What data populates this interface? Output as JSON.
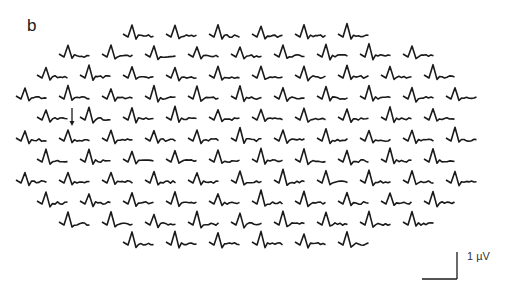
{
  "figure": {
    "panel_label": "b",
    "scale_bar": {
      "label": "1 µV",
      "vertical_px": 27,
      "horizontal_px": 35
    },
    "trace_color": "#1a1a1a",
    "annotation": {
      "type": "arrow-down",
      "row": 4,
      "after_index": 0
    }
  },
  "chart_data": {
    "type": "multi-trace-array",
    "title": "",
    "rows": [
      {
        "y": 35,
        "x_start": 137,
        "count": 6
      },
      {
        "y": 55,
        "x_start": 73,
        "count": 9
      },
      {
        "y": 76,
        "x_start": 51,
        "count": 10
      },
      {
        "y": 97,
        "x_start": 30,
        "count": 11
      },
      {
        "y": 118,
        "x_start": 51,
        "count": 10
      },
      {
        "y": 139,
        "x_start": 30,
        "count": 11
      },
      {
        "y": 160,
        "x_start": 51,
        "count": 10
      },
      {
        "y": 181,
        "x_start": 30,
        "count": 11
      },
      {
        "y": 202,
        "x_start": 51,
        "count": 10
      },
      {
        "y": 223,
        "x_start": 73,
        "count": 9
      },
      {
        "y": 243,
        "x_start": 137,
        "count": 6
      }
    ],
    "column_spacing_px": 43,
    "total_traces": 103,
    "scale": {
      "amplitude": "1 µV"
    }
  }
}
